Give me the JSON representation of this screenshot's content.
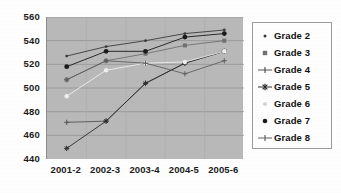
{
  "chart_data": {
    "type": "line",
    "title": "",
    "xlabel": "",
    "ylabel": "",
    "categories": [
      "2001-2",
      "2002-3",
      "2003-4",
      "2004-5",
      "2005-6"
    ],
    "ylim": [
      440,
      560
    ],
    "yticks": [
      440,
      460,
      480,
      500,
      520,
      540,
      560
    ],
    "ytick_labels": [
      "440",
      "460",
      "480",
      "500",
      "520",
      "540",
      "560"
    ],
    "grid": true,
    "legend_position": "right",
    "plot_background": "#b9b9b9",
    "series": [
      {
        "name": "Grade 2",
        "marker": "small-dot",
        "color": "#3a3a3a",
        "values": [
          527,
          535,
          540,
          546,
          549
        ]
      },
      {
        "name": "Grade 3",
        "marker": "square",
        "color": "#707070",
        "values": [
          507,
          523,
          529,
          536,
          540
        ]
      },
      {
        "name": "Grade 4",
        "marker": "plus",
        "color": "#555555",
        "values": [
          471,
          472,
          504,
          521,
          531
        ]
      },
      {
        "name": "Grade 5",
        "marker": "star",
        "color": "#2a2a2a",
        "values": [
          449,
          472,
          504,
          521,
          531
        ]
      },
      {
        "name": "Grade 6",
        "marker": "light-dot",
        "color": "#efefef",
        "values": [
          493,
          515,
          521,
          522,
          531
        ]
      },
      {
        "name": "Grade 7",
        "marker": "filled-dot",
        "color": "#1a1a1a",
        "values": [
          518,
          531,
          531,
          543,
          546
        ]
      },
      {
        "name": "Grade 8",
        "marker": "plus-line",
        "color": "#606060",
        "values": [
          507,
          523,
          521,
          512,
          523
        ]
      }
    ]
  },
  "legend": {
    "items": [
      {
        "label": "Grade 2",
        "marker": "dot-small"
      },
      {
        "label": "Grade 3",
        "marker": "square-gray"
      },
      {
        "label": "Grade 4",
        "marker": "plus"
      },
      {
        "label": "Grade 5",
        "marker": "star"
      },
      {
        "label": "Grade 6",
        "marker": "dot-light"
      },
      {
        "label": "Grade 7",
        "marker": "dot-dark"
      },
      {
        "label": "Grade 8",
        "marker": "plus-dark"
      }
    ]
  }
}
